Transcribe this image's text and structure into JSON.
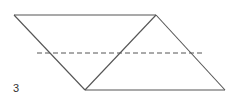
{
  "figure": {
    "label": "3",
    "label_pos": {
      "x": 13,
      "y": 83
    },
    "stroke_color": "#555555",
    "vertices": {
      "top_left": [
        14,
        15
      ],
      "top_right": [
        156,
        15
      ],
      "bottom_left": [
        85,
        90
      ],
      "bottom_right": [
        225,
        90
      ]
    },
    "segments": [
      {
        "name": "top-edge",
        "from": "top_left",
        "to": "top_right",
        "style": "solid"
      },
      {
        "name": "left-edge",
        "from": "top_left",
        "to": "bottom_left",
        "style": "solid"
      },
      {
        "name": "diagonal",
        "from": "bottom_left",
        "to": "top_right",
        "style": "solid"
      },
      {
        "name": "right-edge",
        "from": "top_right",
        "to": "bottom_right",
        "style": "solid"
      },
      {
        "name": "bottom-edge",
        "from": "bottom_left",
        "to": "bottom_right",
        "style": "solid"
      }
    ],
    "dashed_line": {
      "x1": 37,
      "y1": 53,
      "x2": 204,
      "y2": 53,
      "style": "dashed"
    }
  }
}
